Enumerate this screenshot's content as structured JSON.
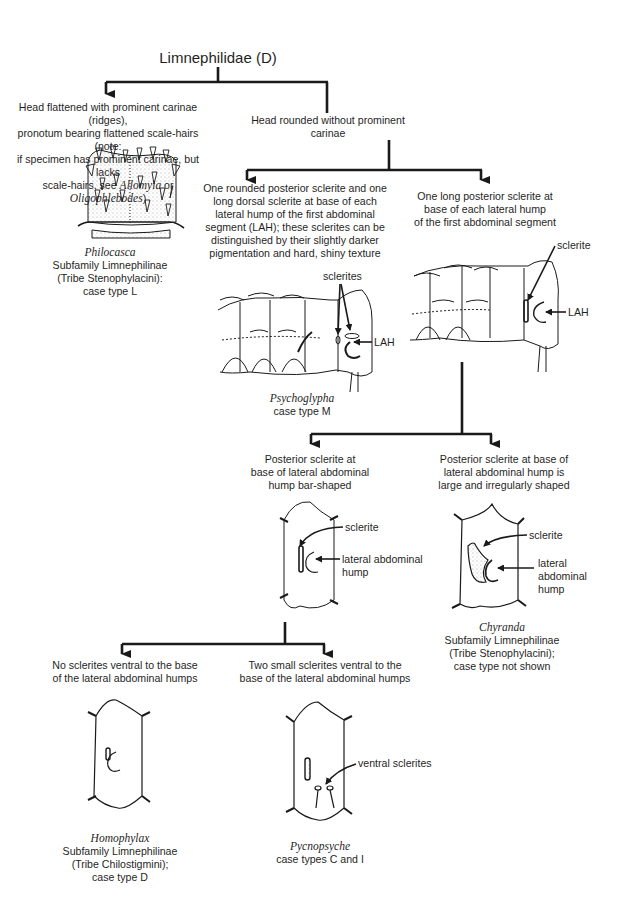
{
  "title": "Limnephilidae (D)",
  "nodes": {
    "flattened_head": {
      "lines": [
        "Head flattened with prominent carinae (ridges),",
        "pronotum bearing flattened scale-hairs (note:",
        "if specimen has prominent carinae, but lacks"
      ],
      "line4_pre": "scale-hairs, see ",
      "line4_genus1": "Allomyia",
      "line4_mid": " or ",
      "line4_genus2": "Oligophlebodes",
      "line4_post": ")",
      "result": {
        "genus": "Philocasca",
        "subfamily": "Subfamily Limnephilinae",
        "tribe": "(Tribe Stenophylacini):",
        "case_type": "case type L"
      }
    },
    "rounded_head": {
      "text": "Head rounded without prominent carinae"
    },
    "two_sclerites": {
      "lines": [
        "One rounded posterior sclerite and one",
        "long dorsal sclerite at base of each",
        "lateral hump of the first abdominal",
        "segment (LAH); these sclerites can be",
        "distinguished by their slightly darker",
        "pigmentation and hard, shiny texture"
      ],
      "labels": {
        "sclerites": "sclerites",
        "lah": "LAH"
      },
      "result": {
        "genus": "Psychoglypha",
        "case_type": "case type M"
      }
    },
    "one_long_sclerite": {
      "lines": [
        "One long posterior sclerite at",
        "base of each lateral hump",
        "of the first abdominal segment"
      ],
      "labels": {
        "sclerite": "sclerite",
        "lah": "LAH"
      }
    },
    "bar_shaped": {
      "lines": [
        "Posterior sclerite at",
        "base of lateral abdominal",
        "hump bar-shaped"
      ],
      "labels": {
        "sclerite": "sclerite",
        "hump_1": "lateral abdominal",
        "hump_2": "hump"
      }
    },
    "irregular": {
      "lines": [
        "Posterior sclerite at base of",
        "lateral abdominal hump is",
        "large and irregularly shaped"
      ],
      "labels": {
        "sclerite": "sclerite",
        "hump_1": "lateral",
        "hump_2": "abdominal",
        "hump_3": "hump"
      },
      "result": {
        "genus": "Chyranda",
        "subfamily": "Subfamily Limnephilinae",
        "tribe": "(Tribe Stenophylacini);",
        "case_type": "case type not shown"
      }
    },
    "no_ventral": {
      "lines": [
        "No sclerites ventral to the base",
        "of the lateral abdominal humps"
      ],
      "result": {
        "genus": "Homophylax",
        "subfamily": "Subfamily Limnephilinae",
        "tribe": "(Tribe Chilostigmini);",
        "case_type": "case type D"
      }
    },
    "two_ventral": {
      "lines": [
        "Two small sclerites ventral to the",
        "base of the lateral abdominal humps"
      ],
      "labels": {
        "ventral": "ventral sclerites"
      },
      "result": {
        "genus": "Pycnopsyche",
        "case_type": "case types C and I"
      }
    }
  },
  "colors": {
    "ink": "#1a1a1a",
    "background": "#ffffff",
    "stipple": "#9a9a9a"
  }
}
